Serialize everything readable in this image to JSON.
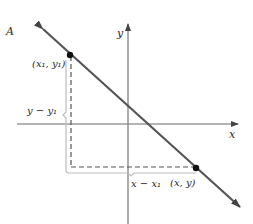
{
  "figure": {
    "panel_label": "A",
    "axes": {
      "x_label": "x",
      "y_label": "y"
    },
    "points": {
      "p1_label": "(x₁, y₁)",
      "p2_label": "(x, y)"
    },
    "brackets": {
      "vertical_label": "y − y₁",
      "horizontal_label": "x − x₁"
    },
    "colors": {
      "line": "#555555",
      "axis": "#6a6a6a",
      "point": "#111111",
      "dashed": "#555555",
      "bracket": "#bdbdbd",
      "text": "#2a2a2a"
    }
  }
}
